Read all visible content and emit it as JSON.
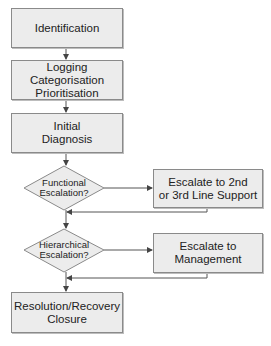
{
  "diagram": {
    "nodes": [
      {
        "id": "identification",
        "type": "process",
        "label": "Identification"
      },
      {
        "id": "logging",
        "type": "process",
        "label": "Logging\nCategorisation\nPrioritisation"
      },
      {
        "id": "initial-diagnosis",
        "type": "process",
        "label": "Initial\nDiagnosis"
      },
      {
        "id": "functional-escalation",
        "type": "decision",
        "label": "Functional\nEscalation?"
      },
      {
        "id": "escalate-line-support",
        "type": "process",
        "label": "Escalate to 2nd\nor 3rd Line Support"
      },
      {
        "id": "hierarchical-escalation",
        "type": "decision",
        "label": "Hierarchical\nEscalation?"
      },
      {
        "id": "escalate-management",
        "type": "process",
        "label": "Escalate to\nManagement"
      },
      {
        "id": "resolution",
        "type": "process",
        "label": "Resolution/Recovery\nClosure"
      }
    ],
    "edges": [
      {
        "from": "identification",
        "to": "logging"
      },
      {
        "from": "logging",
        "to": "initial-diagnosis"
      },
      {
        "from": "initial-diagnosis",
        "to": "functional-escalation"
      },
      {
        "from": "functional-escalation",
        "to": "escalate-line-support"
      },
      {
        "from": "escalate-line-support",
        "to": "hierarchical-escalation"
      },
      {
        "from": "functional-escalation",
        "to": "hierarchical-escalation"
      },
      {
        "from": "hierarchical-escalation",
        "to": "escalate-management"
      },
      {
        "from": "escalate-management",
        "to": "resolution"
      },
      {
        "from": "hierarchical-escalation",
        "to": "resolution"
      }
    ],
    "colors": {
      "fill": "#ececec",
      "stroke": "#8a8a8a",
      "line": "#555555"
    }
  }
}
